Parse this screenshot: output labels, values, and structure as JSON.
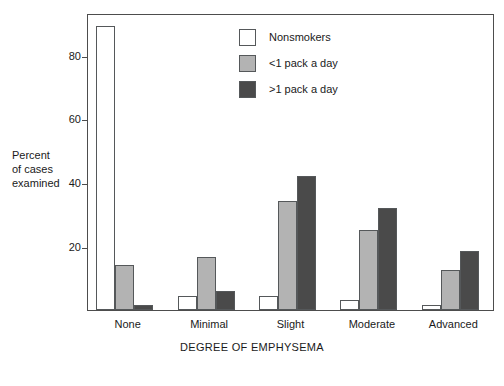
{
  "chart_data": {
    "type": "bar",
    "title": "",
    "subtitle": "",
    "xlabel": "DEGREE OF EMPHYSEMA",
    "ylabel": "Percent of cases examined",
    "ylabel_lines": [
      "Percent",
      "of cases",
      "examined"
    ],
    "categories": [
      "None",
      "Minimal",
      "Slight",
      "Moderate",
      "Advanced"
    ],
    "series": [
      {
        "name": "Nonsmokers",
        "color": "#ffffff",
        "values": [
          89,
          4.5,
          4.5,
          3,
          1.5
        ]
      },
      {
        "name": "<1 pack a day",
        "color": "#b3b3b3",
        "values": [
          14,
          16.5,
          34,
          25,
          12.5
        ]
      },
      {
        "name": ">1 pack a day",
        "color": "#4a4a4a",
        "values": [
          1.5,
          6,
          42,
          32,
          18.5
        ]
      }
    ],
    "ylim": [
      0,
      93
    ],
    "yticks": [
      20,
      40,
      60,
      80
    ],
    "ytick_labels": [
      "20",
      "40",
      "60",
      "80"
    ],
    "grid": false,
    "legend_position": "top-center",
    "frame": true
  },
  "legend": {
    "items": [
      {
        "label": "Nonsmokers"
      },
      {
        "label": "<1 pack a day"
      },
      {
        "label": ">1 pack a day"
      }
    ]
  },
  "axes": {
    "x_title": "DEGREE OF EMPHYSEMA",
    "y_title_lines": [
      "Percent",
      "of cases",
      "examined"
    ]
  }
}
